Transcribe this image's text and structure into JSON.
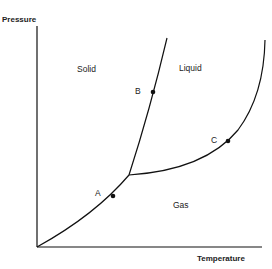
{
  "diagram": {
    "title_fragment": "",
    "type": "phase-diagram",
    "axes": {
      "y_label": "Pressure",
      "x_label": "Temperature"
    },
    "regions": [
      {
        "name": "Solid"
      },
      {
        "name": "Liquid"
      },
      {
        "name": "Gas"
      }
    ],
    "points": [
      {
        "label": "A",
        "on": "sublimation curve"
      },
      {
        "label": "B",
        "on": "fusion curve"
      },
      {
        "label": "C",
        "on": "vaporization curve"
      }
    ],
    "colors": {
      "line": "#111111",
      "text": "#222222",
      "background": "#ffffff"
    }
  }
}
